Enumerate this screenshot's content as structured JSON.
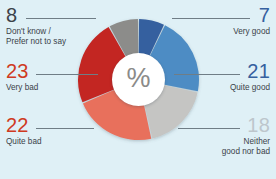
{
  "chart_data": {
    "type": "pie",
    "variant": "donut",
    "title": "",
    "subtitle": "",
    "xlabel": "",
    "ylabel": "",
    "unit_symbol": "%",
    "legend_position": "callouts",
    "grid": false,
    "categories": [
      "Very good",
      "Quite good",
      "Neither good nor bad",
      "Quite bad",
      "Very bad",
      "Don't know /\nPrefer not to say"
    ],
    "values": [
      7,
      21,
      18,
      22,
      23,
      8
    ],
    "colors": [
      "#35609f",
      "#4d8cc4",
      "#c5c5c3",
      "#e8705c",
      "#c32521",
      "#8c8c8a"
    ],
    "slices": [
      {
        "id": "very-good",
        "label": "Very good",
        "value": 7,
        "value_text": "7",
        "color": "#35609f",
        "value_color": "#35609f",
        "side": "right"
      },
      {
        "id": "quite-good",
        "label": "Quite good",
        "value": 21,
        "value_text": "21",
        "color": "#4d8cc4",
        "value_color": "#35609f",
        "side": "right"
      },
      {
        "id": "neither",
        "label": "Neither\ngood nor bad",
        "value": 18,
        "value_text": "18",
        "color": "#c5c5c3",
        "value_color": "#bdc6cc",
        "side": "right"
      },
      {
        "id": "quite-bad",
        "label": "Quite bad",
        "value": 22,
        "value_text": "22",
        "color": "#e8705c",
        "value_color": "#cf3a22",
        "side": "left"
      },
      {
        "id": "very-bad",
        "label": "Very bad",
        "value": 23,
        "value_text": "23",
        "color": "#c32521",
        "value_color": "#cf3a22",
        "side": "left"
      },
      {
        "id": "dont-know",
        "label": "Don't know /\nPrefer not to say",
        "value": 8,
        "value_text": "8",
        "color": "#8c8c8a",
        "value_color": "#3b4249",
        "side": "left"
      }
    ]
  },
  "figure": {
    "background_color": "#dff0f6",
    "hub_symbol": "%"
  }
}
